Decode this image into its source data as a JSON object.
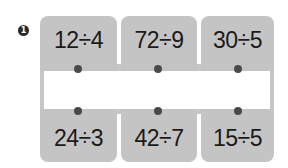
{
  "problem": {
    "number": "1",
    "marker_icon": "filled-circle-number-icon"
  },
  "top_cards": [
    {
      "expression": "12÷4"
    },
    {
      "expression": "72÷9"
    },
    {
      "expression": "30÷5"
    }
  ],
  "bottom_cards": [
    {
      "expression": "24÷3"
    },
    {
      "expression": "42÷7"
    },
    {
      "expression": "15÷5"
    }
  ],
  "colors": {
    "card": "#c4c4c4",
    "dot": "#4a4a4a",
    "text": "#1a1a1a",
    "band": "#ffffff"
  }
}
